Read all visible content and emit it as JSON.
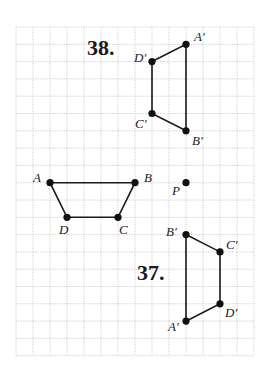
{
  "grid": {
    "origin_x": 16,
    "origin_y": 27,
    "dx": 17.0,
    "dy": 17.3,
    "cols": 14,
    "rows": 19
  },
  "problems": [
    {
      "number": "38.",
      "label_pos": [
        87,
        55
      ],
      "vertices": [
        {
          "name": "A′",
          "col": 10,
          "row": 1,
          "label_dx": 8,
          "label_dy": -3
        },
        {
          "name": "B′",
          "col": 10,
          "row": 6,
          "label_dx": 6,
          "label_dy": 14
        },
        {
          "name": "C′",
          "col": 8,
          "row": 5,
          "label_dx": -17,
          "label_dy": 14
        },
        {
          "name": "D′",
          "col": 8,
          "row": 2,
          "label_dx": -18,
          "label_dy": 0
        }
      ]
    },
    {
      "number": "",
      "vertices": [
        {
          "name": "A",
          "col": 2,
          "row": 9,
          "label_dx": -17,
          "label_dy": -1
        },
        {
          "name": "B",
          "col": 7,
          "row": 9,
          "label_dx": 9,
          "label_dy": -1
        },
        {
          "name": "C",
          "col": 6,
          "row": 11,
          "label_dx": 1,
          "label_dy": 17
        },
        {
          "name": "D",
          "col": 3,
          "row": 11,
          "label_dx": -8,
          "label_dy": 17
        }
      ]
    },
    {
      "number": "37.",
      "label_pos": [
        137,
        280
      ],
      "vertices": [
        {
          "name": "A′",
          "col": 10,
          "row": 17,
          "label_dx": -18,
          "label_dy": 10
        },
        {
          "name": "B′",
          "col": 10,
          "row": 12,
          "label_dx": -20,
          "label_dy": 1
        },
        {
          "name": "C′",
          "col": 12,
          "row": 13,
          "label_dx": 6,
          "label_dy": -3
        },
        {
          "name": "D′",
          "col": 12,
          "row": 16,
          "label_dx": 5,
          "label_dy": 13
        }
      ]
    }
  ],
  "center_point": {
    "name": "P",
    "col": 10,
    "row": 9,
    "label_dx": -14,
    "label_dy": 12
  },
  "labels": {
    "problem_38": "38.",
    "problem_37": "37.",
    "center": "P"
  },
  "colors": {
    "grid": "#b8b8b8",
    "ink": "#1a1a1a",
    "background": "#ffffff"
  }
}
